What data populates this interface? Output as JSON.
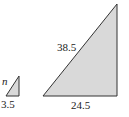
{
  "diagram": {
    "type": "similar-right-triangles",
    "fill_color": "#d9d9d9",
    "stroke_color": "#333333",
    "small_triangle": {
      "hypotenuse_label": "n",
      "base_label": "3.5"
    },
    "large_triangle": {
      "hypotenuse_label": "38.5",
      "base_label": "24.5"
    }
  }
}
